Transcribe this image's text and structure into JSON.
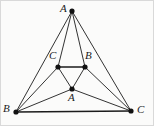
{
  "figure": {
    "background_color": "#fbfbfa",
    "line_color": "#1c1c1c",
    "vertex_color": "#111111",
    "labels": {
      "outer_apex": "A",
      "outer_left": "B",
      "outer_right": "C",
      "inner_left": "C",
      "inner_right": "B",
      "inner_bottom": "A"
    }
  },
  "chart_data": {
    "type": "diagram",
    "points": [
      {
        "name": "A",
        "label": "A",
        "x": 72,
        "y": 11,
        "label_x": 60,
        "label_y": 3,
        "role": "outer-apex"
      },
      {
        "name": "B",
        "label": "B",
        "x": 16,
        "y": 112,
        "label_x": 3,
        "label_y": 103,
        "role": "outer-left"
      },
      {
        "name": "C",
        "label": "C",
        "x": 131,
        "y": 111,
        "label_x": 137,
        "label_y": 104,
        "role": "outer-right"
      },
      {
        "name": "Cp",
        "label": "C",
        "x": 58,
        "y": 67,
        "label_x": 49,
        "label_y": 50,
        "role": "inner-left"
      },
      {
        "name": "Bp",
        "label": "B",
        "x": 85,
        "y": 67,
        "label_x": 85,
        "label_y": 50,
        "role": "inner-right"
      },
      {
        "name": "Ap",
        "label": "A",
        "x": 72,
        "y": 89,
        "label_x": 68,
        "label_y": 92,
        "role": "inner-bottom"
      }
    ],
    "edges": [
      {
        "from": "A",
        "to": "B",
        "weight": "normal"
      },
      {
        "from": "A",
        "to": "C",
        "weight": "normal"
      },
      {
        "from": "B",
        "to": "C",
        "weight": "thick"
      },
      {
        "from": "A",
        "to": "Cp",
        "weight": "normal"
      },
      {
        "from": "A",
        "to": "Bp",
        "weight": "normal"
      },
      {
        "from": "B",
        "to": "Cp",
        "weight": "normal"
      },
      {
        "from": "B",
        "to": "Ap",
        "weight": "normal"
      },
      {
        "from": "C",
        "to": "Bp",
        "weight": "normal"
      },
      {
        "from": "C",
        "to": "Ap",
        "weight": "normal"
      },
      {
        "from": "Cp",
        "to": "Bp",
        "weight": "thick"
      },
      {
        "from": "Cp",
        "to": "Ap",
        "weight": "normal"
      },
      {
        "from": "Bp",
        "to": "Ap",
        "weight": "normal"
      }
    ],
    "vertex_radius": 2.6,
    "xlim": [
      0,
      154
    ],
    "ylim": [
      0,
      126
    ],
    "grid": false,
    "legend": null
  }
}
